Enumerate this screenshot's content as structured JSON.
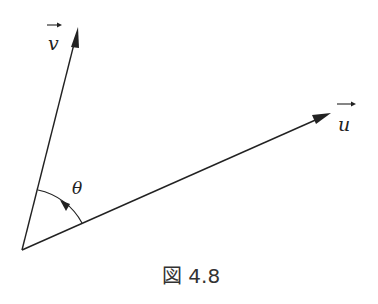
{
  "figure": {
    "caption": "図 4.8",
    "vectors": [
      {
        "name": "v",
        "label": "v",
        "has_overarrow": true,
        "from": [
          22,
          250
        ],
        "to": [
          78,
          27
        ]
      },
      {
        "name": "u",
        "label": "u",
        "has_overarrow": true,
        "from": [
          22,
          250
        ],
        "to": [
          331,
          113
        ]
      }
    ],
    "angle": {
      "label": "θ",
      "between": [
        "u",
        "v"
      ],
      "direction": "counterclockwise"
    },
    "colors": {
      "stroke": "#222222",
      "background": "#ffffff"
    }
  }
}
